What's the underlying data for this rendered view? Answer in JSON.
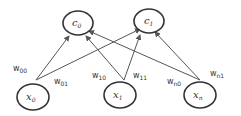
{
  "diagram": {
    "type": "bipartite-network",
    "colors": {
      "stroke": "#333333",
      "edge": "#555555",
      "background": "#ffffff"
    },
    "output_nodes": [
      {
        "id": "c0",
        "label": "c",
        "subscript": "0"
      },
      {
        "id": "c1",
        "label": "c",
        "subscript": "1"
      }
    ],
    "input_nodes": [
      {
        "id": "x0",
        "label": "x",
        "subscript": "0"
      },
      {
        "id": "x1",
        "label": "x",
        "subscript": "1"
      },
      {
        "id": "xn",
        "label": "x",
        "subscript": "n"
      }
    ],
    "edges": [
      {
        "from": "x0",
        "to": "c0",
        "weight": "w",
        "weight_sub": "00"
      },
      {
        "from": "x0",
        "to": "c1",
        "weight": "w",
        "weight_sub": "01"
      },
      {
        "from": "x1",
        "to": "c0",
        "weight": "w",
        "weight_sub": "10"
      },
      {
        "from": "x1",
        "to": "c1",
        "weight": "w",
        "weight_sub": "11"
      },
      {
        "from": "xn",
        "to": "c0",
        "weight": "w",
        "weight_sub": "n0"
      },
      {
        "from": "xn",
        "to": "c1",
        "weight": "w",
        "weight_sub": "n1"
      }
    ]
  }
}
